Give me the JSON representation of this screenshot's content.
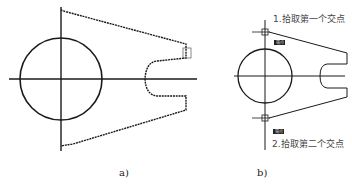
{
  "panels": [
    {
      "id": "a",
      "caption": "a)"
    },
    {
      "id": "b",
      "caption": "b)",
      "annotations": [
        {
          "text": "1.拾取第一个交点"
        },
        {
          "text": "2.拾取第二个交点"
        }
      ],
      "tags": [
        {
          "text": "端点"
        },
        {
          "text": "端点"
        }
      ]
    }
  ],
  "colors": {
    "line": "#1a1a1a",
    "text": "#333333",
    "background": "#ffffff"
  }
}
